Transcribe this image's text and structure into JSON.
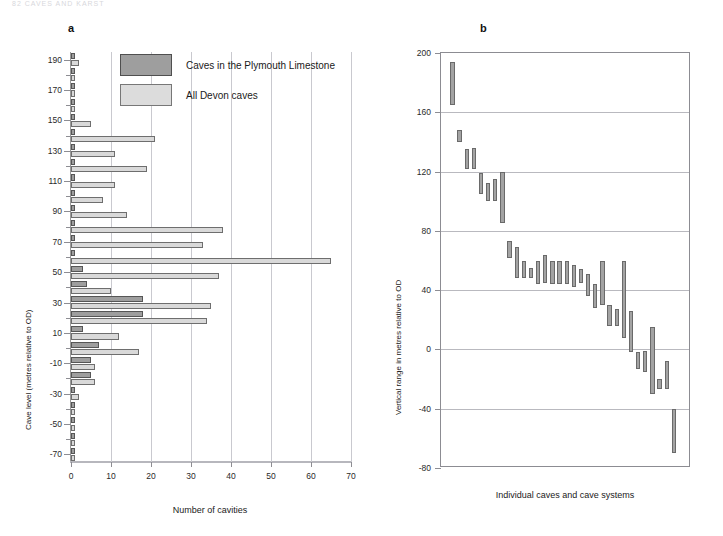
{
  "running_head": "82   CAVES   AND   KARST",
  "panel_a": {
    "letter": "a",
    "legend": [
      {
        "key": "plymouth",
        "label": "Caves in the Plymouth Limestone",
        "color": "#9e9e9e"
      },
      {
        "key": "devon",
        "label": "All Devon caves",
        "color": "#dcdcdc"
      }
    ],
    "xlabel": "Number of cavities",
    "ylabel": "Cave level (metres relative to OD)"
  },
  "panel_b": {
    "letter": "b",
    "xlabel": "Individual caves and cave systems",
    "ylabel": "Vertical range in metres relative to OD",
    "bar_color": "#a3a3a3"
  },
  "chart_data": [
    {
      "type": "bar",
      "orientation": "horizontal",
      "title": "a",
      "xlabel": "Number of cavities",
      "ylabel": "Cave level (metres relative to OD)",
      "xlim": [
        0,
        70
      ],
      "xticks": [
        0,
        10,
        20,
        30,
        40,
        50,
        60,
        70
      ],
      "ylim": [
        -75,
        195
      ],
      "yticks": [
        190,
        180,
        170,
        160,
        150,
        140,
        130,
        120,
        110,
        100,
        90,
        80,
        70,
        60,
        50,
        40,
        30,
        20,
        10,
        0,
        -10,
        -20,
        -30,
        -40,
        -50,
        -60,
        -70
      ],
      "ytick_labels": [
        190,
        170,
        150,
        130,
        110,
        90,
        70,
        50,
        30,
        10,
        -10,
        -30,
        -50,
        -70
      ],
      "grid": "vertical",
      "legend_position": "top-center",
      "categories": [
        190,
        180,
        170,
        160,
        150,
        140,
        130,
        120,
        110,
        100,
        90,
        80,
        70,
        60,
        50,
        40,
        30,
        20,
        10,
        0,
        -10,
        -20,
        -30,
        -40,
        -50,
        -60,
        -70
      ],
      "series": [
        {
          "name": "Caves in the Plymouth Limestone",
          "color": "#9e9e9e",
          "values": [
            1,
            1,
            1,
            1,
            1,
            1,
            1,
            1,
            1,
            1,
            1,
            1,
            1,
            1,
            3,
            4,
            18,
            18,
            3,
            7,
            5,
            5,
            1,
            1,
            1,
            1,
            1
          ]
        },
        {
          "name": "All Devon caves",
          "color": "#dcdcdc",
          "values": [
            2,
            1,
            1,
            1,
            5,
            21,
            11,
            19,
            11,
            8,
            14,
            38,
            33,
            65,
            37,
            10,
            35,
            34,
            12,
            17,
            6,
            6,
            2,
            1,
            1,
            1,
            1
          ]
        }
      ]
    },
    {
      "type": "bar",
      "variant": "floating-range",
      "title": "b",
      "xlabel": "Individual caves and cave systems",
      "ylabel": "Vertical range in metres relative to OD",
      "ylim": [
        -80,
        200
      ],
      "yticks": [
        200,
        160,
        120,
        80,
        40,
        0,
        -40,
        -80
      ],
      "grid": "horizontal",
      "legend_position": "none",
      "n_caves": 31,
      "ranges": [
        {
          "index": 1,
          "top": 194,
          "bottom": 165
        },
        {
          "index": 2,
          "top": 148,
          "bottom": 140
        },
        {
          "index": 3,
          "top": 135,
          "bottom": 122
        },
        {
          "index": 4,
          "top": 136,
          "bottom": 122
        },
        {
          "index": 5,
          "top": 119,
          "bottom": 105
        },
        {
          "index": 6,
          "top": 112,
          "bottom": 100
        },
        {
          "index": 7,
          "top": 115,
          "bottom": 100
        },
        {
          "index": 8,
          "top": 120,
          "bottom": 85
        },
        {
          "index": 9,
          "top": 73,
          "bottom": 62
        },
        {
          "index": 10,
          "top": 69,
          "bottom": 48
        },
        {
          "index": 11,
          "top": 60,
          "bottom": 48
        },
        {
          "index": 12,
          "top": 55,
          "bottom": 48
        },
        {
          "index": 13,
          "top": 60,
          "bottom": 44
        },
        {
          "index": 14,
          "top": 64,
          "bottom": 45
        },
        {
          "index": 15,
          "top": 60,
          "bottom": 44
        },
        {
          "index": 16,
          "top": 60,
          "bottom": 44
        },
        {
          "index": 17,
          "top": 60,
          "bottom": 44
        },
        {
          "index": 18,
          "top": 57,
          "bottom": 42
        },
        {
          "index": 19,
          "top": 54,
          "bottom": 45
        },
        {
          "index": 20,
          "top": 51,
          "bottom": 36
        },
        {
          "index": 21,
          "top": 44,
          "bottom": 28
        },
        {
          "index": 22,
          "top": 60,
          "bottom": 30
        },
        {
          "index": 23,
          "top": 30,
          "bottom": 16
        },
        {
          "index": 24,
          "top": 27,
          "bottom": 16
        },
        {
          "index": 25,
          "top": 60,
          "bottom": 8
        },
        {
          "index": 26,
          "top": 26,
          "bottom": -2
        },
        {
          "index": 27,
          "top": -2,
          "bottom": -13
        },
        {
          "index": 28,
          "top": -1,
          "bottom": -15
        },
        {
          "index": 29,
          "top": 15,
          "bottom": -30
        },
        {
          "index": 30,
          "top": -20,
          "bottom": -27
        },
        {
          "index": 31,
          "top": -8,
          "bottom": -27
        },
        {
          "index": 32,
          "top": -40,
          "bottom": -70
        }
      ]
    }
  ]
}
